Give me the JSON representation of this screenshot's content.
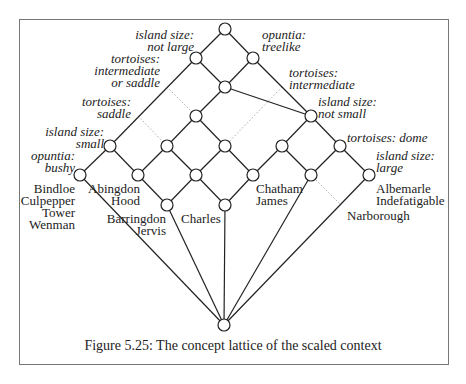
{
  "figure": {
    "caption": "Figure 5.25: The concept lattice of the scaled context"
  },
  "attributes": {
    "island_not_large": [
      "island size:",
      "not large"
    ],
    "opuntia_treelike": [
      "opuntia:",
      "treelike"
    ],
    "tortoises_int_or_saddle": [
      "tortoises:",
      "intermediate",
      "or saddle"
    ],
    "tortoises_intermediate": [
      "tortoises:",
      "intermediate"
    ],
    "tortoises_saddle": [
      "tortoises:",
      "saddle"
    ],
    "island_not_small": [
      "island size:",
      "not small"
    ],
    "island_small": [
      "island size:",
      "small"
    ],
    "tortoises_dome": [
      "tortoises: dome"
    ],
    "opuntia_bushy": [
      "opuntia:",
      "bushy"
    ],
    "island_large": [
      "island size:",
      "large"
    ]
  },
  "objects": {
    "group_bindloe": [
      "Bindloe",
      "Culpepper",
      "Tower",
      "Wenman"
    ],
    "group_abingdon": [
      "Abingdon",
      "Hood"
    ],
    "group_barringdon": [
      "Barringdon",
      "Jervis"
    ],
    "group_charles": [
      "Charles"
    ],
    "group_chatham": [
      "Chatham",
      "James"
    ],
    "group_albemarle": [
      "Albemarle",
      "Indefatigable"
    ],
    "group_narborough": [
      "Narborough"
    ]
  },
  "lattice": {
    "nodes": [
      {
        "id": "top",
        "x": 225,
        "y": 29
      },
      {
        "id": "n1",
        "x": 196,
        "y": 58
      },
      {
        "id": "n2",
        "x": 253,
        "y": 58
      },
      {
        "id": "n3",
        "x": 225,
        "y": 87
      },
      {
        "id": "n4",
        "x": 196,
        "y": 116
      },
      {
        "id": "n5",
        "x": 311,
        "y": 116
      },
      {
        "id": "n6",
        "x": 110,
        "y": 146
      },
      {
        "id": "n7",
        "x": 167,
        "y": 146
      },
      {
        "id": "n8",
        "x": 225,
        "y": 146
      },
      {
        "id": "n9",
        "x": 282,
        "y": 146
      },
      {
        "id": "n10",
        "x": 340,
        "y": 146
      },
      {
        "id": "n11",
        "x": 80,
        "y": 175
      },
      {
        "id": "n12",
        "x": 138,
        "y": 175
      },
      {
        "id": "n13",
        "x": 196,
        "y": 175
      },
      {
        "id": "n14",
        "x": 253,
        "y": 175
      },
      {
        "id": "n15",
        "x": 311,
        "y": 175
      },
      {
        "id": "n16",
        "x": 369,
        "y": 175
      },
      {
        "id": "n17",
        "x": 167,
        "y": 205
      },
      {
        "id": "n18",
        "x": 225,
        "y": 205
      },
      {
        "id": "bottom",
        "x": 224,
        "y": 325
      }
    ],
    "edges": [
      [
        "top",
        "n1"
      ],
      [
        "top",
        "n2"
      ],
      [
        "n1",
        "n3"
      ],
      [
        "n2",
        "n3"
      ],
      [
        "n1",
        "n6"
      ],
      [
        "n2",
        "n5"
      ],
      [
        "n3",
        "n4"
      ],
      [
        "n3",
        "n5"
      ],
      [
        "n4",
        "n7"
      ],
      [
        "n4",
        "n8"
      ],
      [
        "n5",
        "n9"
      ],
      [
        "n5",
        "n10"
      ],
      [
        "n6",
        "n11"
      ],
      [
        "n6",
        "n12"
      ],
      [
        "n7",
        "n12"
      ],
      [
        "n7",
        "n13"
      ],
      [
        "n8",
        "n13"
      ],
      [
        "n8",
        "n14"
      ],
      [
        "n9",
        "n14"
      ],
      [
        "n9",
        "n15"
      ],
      [
        "n10",
        "n15"
      ],
      [
        "n10",
        "n16"
      ],
      [
        "n12",
        "n17"
      ],
      [
        "n13",
        "n17"
      ],
      [
        "n13",
        "n18"
      ],
      [
        "n14",
        "n18"
      ],
      [
        "n11",
        "bottom"
      ],
      [
        "n17",
        "bottom"
      ],
      [
        "n18",
        "bottom"
      ],
      [
        "n15",
        "bottom"
      ],
      [
        "n16",
        "bottom"
      ]
    ],
    "dotted_edges": [
      [
        [
          167,
          87
        ],
        [
          196,
          116
        ]
      ],
      [
        [
          138,
          116
        ],
        [
          167,
          146
        ]
      ],
      [
        [
          282,
          87
        ],
        [
          225,
          146
        ]
      ],
      [
        [
          311,
          175
        ],
        [
          340,
          204
        ]
      ]
    ]
  }
}
